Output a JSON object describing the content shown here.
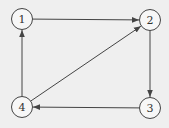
{
  "diagram": {
    "type": "directed-graph",
    "background": "#efefef",
    "stroke_color": "#444444",
    "nodes": [
      {
        "id": "1",
        "label": "1",
        "x": 22,
        "y": 19
      },
      {
        "id": "2",
        "label": "2",
        "x": 150,
        "y": 20
      },
      {
        "id": "3",
        "label": "3",
        "x": 150,
        "y": 108
      },
      {
        "id": "4",
        "label": "4",
        "x": 22,
        "y": 107
      }
    ],
    "edges": [
      {
        "from": "1",
        "to": "2"
      },
      {
        "from": "2",
        "to": "3"
      },
      {
        "from": "3",
        "to": "4"
      },
      {
        "from": "4",
        "to": "1"
      },
      {
        "from": "4",
        "to": "2"
      }
    ]
  }
}
